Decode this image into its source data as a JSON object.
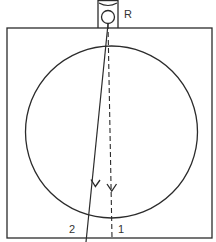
{
  "diagram": {
    "type": "ray-diagram",
    "colors": {
      "stroke": "#2b2b2b",
      "label": "#333333",
      "background": "#ffffff"
    },
    "source": {
      "label": "R"
    },
    "rays": [
      {
        "id": "ray-1",
        "label": "1",
        "style": "dashed",
        "direction": "down"
      },
      {
        "id": "ray-2",
        "label": "2",
        "style": "solid",
        "direction": "down"
      }
    ],
    "container": {
      "shape": "square"
    },
    "sphere": {
      "shape": "circle"
    }
  }
}
